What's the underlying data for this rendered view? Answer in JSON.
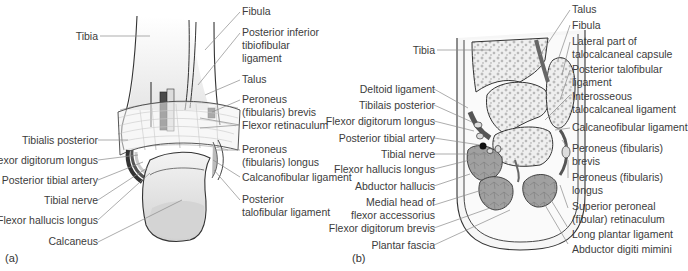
{
  "figure": {
    "panel_a": {
      "tag": "(a)",
      "labels_left": [
        "Tibia",
        "Tibialis posterior",
        "Flexor digitorum longus",
        "Posterior tibial artery",
        "Tibial nerve",
        "Flexor hallucis longus",
        "Calcaneus"
      ],
      "labels_right": [
        "Fibula",
        "Posterior inferior tibiofibular ligament",
        "Talus",
        "Peroneus (fibularis) brevis",
        "Flexor retinaculum",
        "Peroneus (fibularis) longus",
        "Calcanofibular ligament",
        "Posterior talofibular ligament"
      ]
    },
    "panel_b": {
      "tag": "(b)",
      "labels_left": [
        "Tibia",
        "Deltoid ligament",
        "Tibilais posterior",
        "Flexor digitorum longus",
        "Posterior tibial artery",
        "Tibial nerve",
        "Flexor hallucis longus",
        "Abductor hallucis",
        "Medial head of flexor accessorius",
        "Flexor digitorum brevis",
        "Plantar fascia"
      ],
      "labels_right": [
        "Talus",
        "Fibula",
        "Lateral part of talocalcaneal capsule",
        "Posterior talofibular ligament",
        "Interosseous talocalcaneal ligament",
        "Calcaneofibular ligament",
        "Peroneus (fibularis) brevis",
        "Peroneus (fibularis) longus",
        "Superior peroneal (fibular) retinaculum",
        "Long plantar ligament",
        "Abductor digiti mimini"
      ]
    }
  },
  "colors": {
    "bone": "#f2f2f2",
    "outline": "#333333",
    "muscle": "#9a9a9a",
    "tendon_dark": "#555555",
    "leader": "#8a8a8a"
  }
}
